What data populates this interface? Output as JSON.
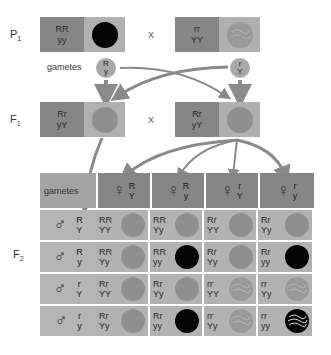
{
  "labels": {
    "p1": "P",
    "p1_sub": "1",
    "f1": "F",
    "f1_sub": "1",
    "f2": "F",
    "f2_sub": "2",
    "gametes": "gametes",
    "cross": "X"
  },
  "p1": [
    {
      "genotype_top": "RR",
      "genotype_bottom": "yy",
      "phenotype": "round green",
      "pea": "green"
    },
    {
      "genotype_top": "rr",
      "genotype_bottom": "YY",
      "phenotype": "wrinkled yellow",
      "pea": "wrinkled-yellow"
    }
  ],
  "p1_gametes": [
    {
      "top": "R",
      "bottom": "y"
    },
    {
      "top": "r",
      "bottom": "Y"
    }
  ],
  "f1": [
    {
      "genotype_top": "Rr",
      "genotype_bottom": "yY",
      "phenotype": "round yellow",
      "pea": "yellow"
    },
    {
      "genotype_top": "Rr",
      "genotype_bottom": "yY",
      "phenotype": "round yellow",
      "pea": "yellow"
    }
  ],
  "punnett": {
    "header_label": "gametes",
    "female_symbol": "♀",
    "male_symbol": "♂",
    "female_gametes": [
      {
        "top": "R",
        "bottom": "Y"
      },
      {
        "top": "R",
        "bottom": "y"
      },
      {
        "top": "r",
        "bottom": "Y"
      },
      {
        "top": "r",
        "bottom": "y"
      }
    ],
    "rows": [
      {
        "male": {
          "top": "R",
          "bottom": "Y"
        },
        "cells": [
          {
            "top": "RR",
            "bottom": "YY",
            "pea": "yellow"
          },
          {
            "top": "RR",
            "bottom": "Yy",
            "pea": "yellow"
          },
          {
            "top": "Rr",
            "bottom": "YY",
            "pea": "yellow"
          },
          {
            "top": "Rr",
            "bottom": "Yy",
            "pea": "yellow"
          }
        ]
      },
      {
        "male": {
          "top": "R",
          "bottom": "y"
        },
        "cells": [
          {
            "top": "RR",
            "bottom": "Yy",
            "pea": "yellow"
          },
          {
            "top": "RR",
            "bottom": "yy",
            "pea": "green"
          },
          {
            "top": "Rr",
            "bottom": "Yy",
            "pea": "yellow"
          },
          {
            "top": "Rr",
            "bottom": "yy",
            "pea": "green"
          }
        ]
      },
      {
        "male": {
          "top": "r",
          "bottom": "Y"
        },
        "cells": [
          {
            "top": "Rr",
            "bottom": "YY",
            "pea": "yellow"
          },
          {
            "top": "Rr",
            "bottom": "Yy",
            "pea": "yellow"
          },
          {
            "top": "rr",
            "bottom": "YY",
            "pea": "wrinkled-yellow"
          },
          {
            "top": "rr",
            "bottom": "Yy",
            "pea": "wrinkled-yellow"
          }
        ]
      },
      {
        "male": {
          "top": "r",
          "bottom": "y"
        },
        "cells": [
          {
            "top": "Rr",
            "bottom": "Yy",
            "pea": "yellow"
          },
          {
            "top": "Rr",
            "bottom": "yy",
            "pea": "green"
          },
          {
            "top": "rr",
            "bottom": "Yy",
            "pea": "wrinkled-yellow"
          },
          {
            "top": "rr",
            "bottom": "yy",
            "pea": "wrinkled-green"
          }
        ]
      }
    ]
  },
  "colors": {
    "genotype_bg": "#868686",
    "phenotype_bg": "#b0b0b0",
    "arrow": "#8a8a8a",
    "green_pea": "#050505",
    "yellow_pea": "#8f8f8f"
  }
}
